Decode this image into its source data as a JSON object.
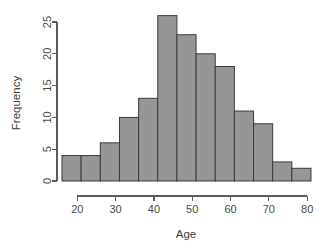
{
  "chart_data": {
    "type": "bar",
    "title": "",
    "subtitle": "",
    "xlabel": "Age",
    "ylabel": "Frequency",
    "xlim": [
      14,
      82
    ],
    "ylim": [
      0,
      26
    ],
    "grid": false,
    "legend": null,
    "bin_width": 5,
    "bin_edges": [
      16,
      21,
      26,
      31,
      36,
      41,
      46,
      51,
      56,
      61,
      66,
      71,
      76,
      81
    ],
    "categories": [
      "16-21",
      "21-26",
      "26-31",
      "31-36",
      "36-41",
      "41-46",
      "46-51",
      "51-56",
      "56-61",
      "61-66",
      "66-71",
      "71-76",
      "76-81"
    ],
    "values": [
      4,
      4,
      6,
      10,
      13,
      26,
      23,
      20,
      18,
      11,
      9,
      3,
      2
    ],
    "x_ticks": [
      20,
      30,
      40,
      50,
      60,
      70,
      80
    ],
    "x_tick_labels": [
      "20",
      "30",
      "40",
      "50",
      "60",
      "70",
      "80"
    ],
    "y_ticks": [
      0,
      5,
      10,
      15,
      20,
      25
    ],
    "y_tick_labels": [
      "0",
      "5",
      "10",
      "15",
      "20",
      "25"
    ],
    "x_axis_range": [
      16,
      81
    ],
    "y_axis_range": [
      0,
      25
    ],
    "bar_fill_color": "#969696",
    "bar_stroke_color": "#3b3b3b",
    "axis_color": "#5b5b5b",
    "text_color": "#4a4a4a",
    "background_color": "#ffffff"
  },
  "labels": {
    "x_axis_title": "Age",
    "y_axis_title": "Frequency"
  }
}
